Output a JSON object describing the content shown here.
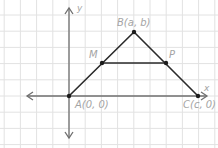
{
  "diagram": {
    "type": "coordinate-geometry-triangle",
    "grid": {
      "spacing": 16.2,
      "origin_px": [
        69,
        96
      ],
      "color": "#e2e2e2"
    },
    "axes": {
      "x_label": "x",
      "y_label": "y",
      "x_axis": {
        "from_px": [
          27,
          96
        ],
        "to_px": [
          207,
          96
        ]
      },
      "y_axis": {
        "from_px": [
          69,
          138
        ],
        "to_px": [
          69,
          8
        ]
      },
      "color": "#6f6f6f"
    },
    "points": [
      {
        "id": "A",
        "label": "A(0, 0)",
        "px": [
          69,
          96
        ]
      },
      {
        "id": "B",
        "label": "B(a, b)",
        "px": [
          134,
          32
        ]
      },
      {
        "id": "C",
        "label": "C(c, 0)",
        "px": [
          198,
          96
        ]
      },
      {
        "id": "M",
        "label": "M",
        "px": [
          102,
          63
        ]
      },
      {
        "id": "P",
        "label": "P",
        "px": [
          166,
          63
        ]
      }
    ],
    "segments": [
      {
        "from": "A",
        "to": "B"
      },
      {
        "from": "B",
        "to": "C"
      },
      {
        "from": "M",
        "to": "P"
      }
    ],
    "colors": {
      "segment": "#2a2a2a",
      "label": "#a4a4a4",
      "point": "#1c1c1c"
    }
  }
}
